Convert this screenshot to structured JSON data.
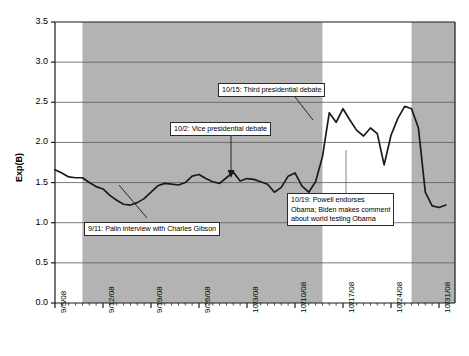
{
  "chart_data": {
    "type": "line",
    "title": "",
    "xlabel": "",
    "ylabel": "Exp(B)",
    "ylim": [
      0.0,
      3.5
    ],
    "ytick_labels": [
      "0.0",
      "0.5",
      "1.0",
      "1.5",
      "2.0",
      "2.5",
      "3.0",
      "3.5"
    ],
    "ytick_values": [
      0.0,
      0.5,
      1.0,
      1.5,
      2.0,
      2.5,
      3.0,
      3.5
    ],
    "xtick_labels": [
      "9/5/08",
      "9/12/08",
      "9/19/08",
      "9/26/08",
      "10/3/08",
      "10/10/08",
      "10/17/08",
      "10/24/08",
      "10/31/08"
    ],
    "grid": "horizontal",
    "legend": "none",
    "line_color": "#1a1a1a",
    "shaded_band_color": "#b3b3b3",
    "background_color": "#ffffff",
    "shaded_bands": [
      {
        "start": "9/9/08",
        "end": "10/14/08"
      },
      {
        "start": "10/27/08",
        "end": "11/2/08"
      }
    ],
    "x": [
      "9/5/08",
      "9/6/08",
      "9/7/08",
      "9/8/08",
      "9/9/08",
      "9/10/08",
      "9/11/08",
      "9/12/08",
      "9/13/08",
      "9/14/08",
      "9/15/08",
      "9/16/08",
      "9/17/08",
      "9/18/08",
      "9/19/08",
      "9/20/08",
      "9/21/08",
      "9/22/08",
      "9/23/08",
      "9/24/08",
      "9/25/08",
      "9/26/08",
      "9/27/08",
      "9/28/08",
      "9/29/08",
      "9/30/08",
      "10/1/08",
      "10/2/08",
      "10/3/08",
      "10/4/08",
      "10/5/08",
      "10/6/08",
      "10/7/08",
      "10/8/08",
      "10/9/08",
      "10/10/08",
      "10/11/08",
      "10/12/08",
      "10/13/08",
      "10/14/08",
      "10/15/08",
      "10/16/08",
      "10/17/08",
      "10/18/08",
      "10/19/08",
      "10/20/08",
      "10/21/08",
      "10/22/08",
      "10/23/08",
      "10/24/08",
      "10/25/08",
      "10/26/08",
      "10/27/08",
      "10/28/08",
      "10/29/08",
      "10/30/08",
      "10/31/08",
      "11/1/08"
    ],
    "values": [
      1.66,
      1.62,
      1.57,
      1.56,
      1.56,
      1.5,
      1.45,
      1.42,
      1.34,
      1.28,
      1.23,
      1.22,
      1.25,
      1.3,
      1.38,
      1.46,
      1.49,
      1.48,
      1.47,
      1.5,
      1.58,
      1.6,
      1.55,
      1.51,
      1.49,
      1.56,
      1.63,
      1.52,
      1.55,
      1.54,
      1.51,
      1.48,
      1.38,
      1.44,
      1.58,
      1.62,
      1.46,
      1.38,
      1.51,
      1.82,
      2.37,
      2.25,
      2.42,
      2.28,
      2.15,
      2.08,
      2.18,
      2.11,
      1.72,
      2.09,
      2.3,
      2.45,
      2.42,
      2.18,
      1.38,
      1.21,
      1.19,
      1.22
    ],
    "annotations": [
      {
        "id": "palin",
        "lines": [
          "9/11: Palin interview with Charles Gibson"
        ],
        "target_date": "9/11/08"
      },
      {
        "id": "vp-debate",
        "lines": [
          "10/2: Vice presidential debate"
        ],
        "target_date": "10/2/08"
      },
      {
        "id": "third-debate",
        "lines": [
          "10/15: Third presidential debate"
        ],
        "target_date": "10/15/08"
      },
      {
        "id": "powell",
        "lines": [
          "10/19: Powell endorses",
          "Obama; Biden makes comment",
          "about world testing Obama"
        ],
        "target_date": "10/19/08"
      }
    ]
  }
}
